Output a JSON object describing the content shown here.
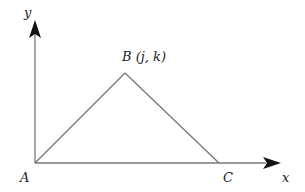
{
  "diagram": {
    "axes": {
      "x_label": "x",
      "y_label": "y"
    },
    "points": {
      "A": {
        "label": "A"
      },
      "B": {
        "label": "B (j, k)"
      },
      "C": {
        "label": "C"
      }
    },
    "colors": {
      "line": "#777777",
      "arrow": "#111111",
      "text": "#222222"
    }
  }
}
